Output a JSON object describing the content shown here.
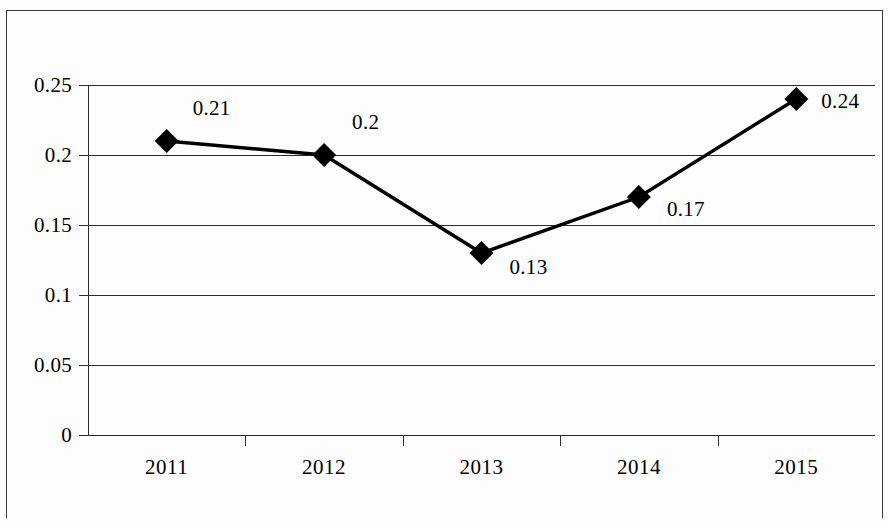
{
  "chart_data": {
    "type": "line",
    "title": "",
    "subtitle": "",
    "xlabel": "",
    "ylabel": "",
    "categories": [
      "2011",
      "2012",
      "2013",
      "2014",
      "2015"
    ],
    "values": [
      0.21,
      0.2,
      0.13,
      0.17,
      0.24
    ],
    "point_labels": [
      "0.21",
      "0.2",
      "0.13",
      "0.17",
      "0.24"
    ],
    "series": [
      {
        "name": "",
        "values": [
          0.21,
          0.2,
          0.13,
          0.17,
          0.24
        ],
        "marker": "diamond",
        "marker_color": "#000000",
        "line_color": "#000000"
      }
    ],
    "ylim": [
      0,
      0.25
    ],
    "y_ticks": [
      "0",
      "0.05",
      "0.1",
      "0.15",
      "0.2",
      "0.25"
    ],
    "y_tick_values": [
      0,
      0.05,
      0.1,
      0.15,
      0.2,
      0.25
    ],
    "grid": true,
    "grid_orientation": "horizontal",
    "legend": false,
    "legend_position": "none",
    "colors": {
      "line": "#000000",
      "marker": "#000000",
      "grid": "#2b2b2b",
      "axis": "#2b2b2b",
      "frame": "#3a3a3a",
      "background": "#fdfdfd"
    }
  }
}
